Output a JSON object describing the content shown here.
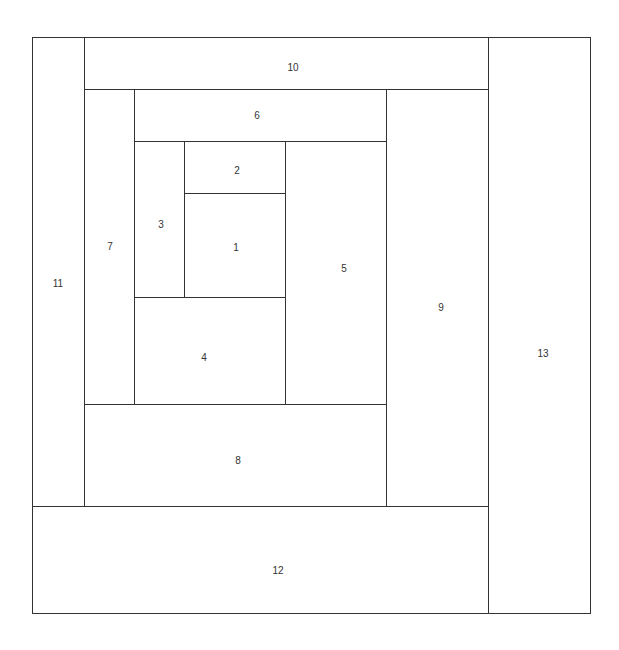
{
  "diagram": {
    "line_color": "#333333",
    "pieces": [
      {
        "id": "1",
        "label": "1",
        "x": 184,
        "y": 193,
        "w": 101,
        "h": 104,
        "lx": 236,
        "ly": 247
      },
      {
        "id": "2",
        "label": "2",
        "x": 184,
        "y": 141,
        "w": 101,
        "h": 52,
        "lx": 237,
        "ly": 170
      },
      {
        "id": "3",
        "label": "3",
        "x": 134,
        "y": 141,
        "w": 50,
        "h": 156,
        "lx": 161,
        "ly": 224
      },
      {
        "id": "4",
        "label": "4",
        "x": 134,
        "y": 297,
        "w": 151,
        "h": 107,
        "lx": 204,
        "ly": 357
      },
      {
        "id": "5",
        "label": "5",
        "x": 285,
        "y": 141,
        "w": 101,
        "h": 263,
        "lx": 344,
        "ly": 268
      },
      {
        "id": "6",
        "label": "6",
        "x": 134,
        "y": 89,
        "w": 252,
        "h": 52,
        "lx": 257,
        "ly": 115
      },
      {
        "id": "7",
        "label": "7",
        "x": 84,
        "y": 89,
        "w": 50,
        "h": 315,
        "lx": 110,
        "ly": 246
      },
      {
        "id": "8",
        "label": "8",
        "x": 84,
        "y": 404,
        "w": 302,
        "h": 102,
        "lx": 238,
        "ly": 460
      },
      {
        "id": "9",
        "label": "9",
        "x": 386,
        "y": 89,
        "w": 102,
        "h": 417,
        "lx": 441,
        "ly": 307
      },
      {
        "id": "10",
        "label": "10",
        "x": 84,
        "y": 37,
        "w": 404,
        "h": 52,
        "lx": 293,
        "ly": 67
      },
      {
        "id": "11",
        "label": "11",
        "x": 32,
        "y": 37,
        "w": 52,
        "h": 469,
        "lx": 58,
        "ly": 283
      },
      {
        "id": "12",
        "label": "12",
        "x": 32,
        "y": 506,
        "w": 456,
        "h": 107,
        "lx": 278,
        "ly": 570
      },
      {
        "id": "13",
        "label": "13",
        "x": 488,
        "y": 37,
        "w": 102,
        "h": 576,
        "lx": 543,
        "ly": 353
      }
    ]
  }
}
